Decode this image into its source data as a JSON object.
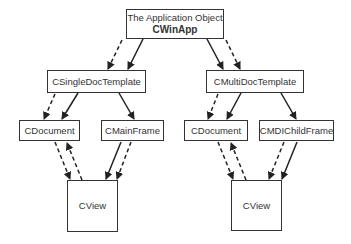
{
  "diagram": {
    "nodes": {
      "app": {
        "line1": "The Application Object",
        "line2": "CWinApp"
      },
      "sdt": {
        "label": "CSingleDocTemplate"
      },
      "mdt": {
        "label": "CMultiDocTemplate"
      },
      "doc_left": {
        "label": "CDocument"
      },
      "mainframe": {
        "label": "CMainFrame"
      },
      "doc_right": {
        "label": "CDocument"
      },
      "mdichild": {
        "label": "CMDIChildFrame"
      },
      "view_left": {
        "label": "CView"
      },
      "view_right": {
        "label": "CView"
      }
    },
    "edges": [
      {
        "from": "app",
        "to": "sdt",
        "style": "solid"
      },
      {
        "from": "app",
        "to": "sdt",
        "style": "dashed"
      },
      {
        "from": "app",
        "to": "mdt",
        "style": "solid"
      },
      {
        "from": "app",
        "to": "mdt",
        "style": "dashed"
      },
      {
        "from": "sdt",
        "to": "doc_left",
        "style": "solid"
      },
      {
        "from": "sdt",
        "to": "doc_left",
        "style": "dashed"
      },
      {
        "from": "sdt",
        "to": "mainframe",
        "style": "solid"
      },
      {
        "from": "mdt",
        "to": "doc_right",
        "style": "solid"
      },
      {
        "from": "mdt",
        "to": "doc_right",
        "style": "dashed"
      },
      {
        "from": "mdt",
        "to": "mdichild",
        "style": "solid"
      },
      {
        "from": "doc_left",
        "to": "view_left",
        "style": "dashed"
      },
      {
        "from": "view_left",
        "to": "doc_left",
        "style": "dashed"
      },
      {
        "from": "mainframe",
        "to": "view_left",
        "style": "solid"
      },
      {
        "from": "mainframe",
        "to": "view_left",
        "style": "dashed"
      },
      {
        "from": "doc_right",
        "to": "view_right",
        "style": "dashed"
      },
      {
        "from": "view_right",
        "to": "doc_right",
        "style": "dashed"
      },
      {
        "from": "mdichild",
        "to": "view_right",
        "style": "dashed"
      },
      {
        "from": "mdichild",
        "to": "view_right",
        "style": "solid"
      }
    ],
    "colors": {
      "stroke": "#333333",
      "background": "#ffffff"
    }
  }
}
